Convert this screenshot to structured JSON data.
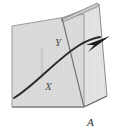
{
  "figure": {
    "caption_label": "A",
    "labels": {
      "plane_front": "X",
      "plane_rear": "Y",
      "figure_id": "A"
    },
    "colors": {
      "background": "#ffffff",
      "plane_fill": "#dcdcdc",
      "plane_fill_light": "#e4e4e4",
      "plane_stroke": "#8d8d8d",
      "plane_stroke_dark": "#6f6f6f",
      "trajectory_stroke": "#2b2b2b",
      "arrowhead_fill": "#1c1c1c",
      "label_color": "#4a4a4a",
      "caption_color": "#2e2e2e"
    },
    "elements": {
      "plane_x_name": "front quadrilateral plane",
      "plane_y_name": "rear tilted plane",
      "sliver_name": "thin top edge sliver",
      "trajectory_name": "curved trajectory arrow",
      "intersection_name": "plane intersection line"
    }
  },
  "geometry": {
    "plane_x_points": "12,26 84,14 84,107 12,107",
    "plane_y_points": "62,18 99,4 107,96 84,107",
    "sliver_points": "61,20 97,3 99,6 63,22",
    "intersection_line": "62,18 84,107",
    "right_edge_line": "84,107 107,96",
    "trajectory_path": "M 14,98 C 34,86 56,60 78,46 C 86,41 94,38 100,37",
    "arrowhead_points": "110,36 86,45 94,45 88,52"
  }
}
